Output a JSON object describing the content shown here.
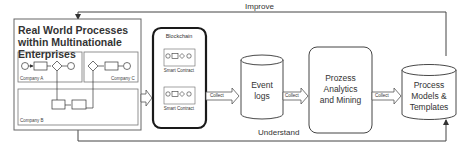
{
  "diagram": {
    "loop_labels": {
      "top": "Improve",
      "bottom": "Understand"
    },
    "enterprise_box": {
      "title": "Real World Processes within Multinationale Enterprises",
      "companies": [
        "Company A",
        "Company C",
        "Company B"
      ]
    },
    "blockchain": {
      "title": "Blockchain",
      "contracts": [
        "Smart Contract",
        "Smart Contract"
      ]
    },
    "event_logs": {
      "line1": "Event",
      "line2": "logs"
    },
    "analytics": {
      "line1": "Prozess",
      "line2": "Analytics",
      "line3": "and Mining"
    },
    "models": {
      "line1": "Process",
      "line2": "Models &",
      "line3": "Templates"
    },
    "arrows": {
      "collect1": "Collect",
      "collect2": "Collect",
      "collect3": "Collect"
    },
    "colors": {
      "line": "#444444",
      "blockchain_border": "#1a1a1a"
    }
  }
}
